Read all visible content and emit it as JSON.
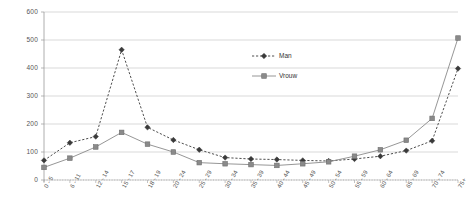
{
  "chart_data": {
    "type": "line",
    "title": "",
    "xlabel": "",
    "ylabel": "",
    "ylim": [
      0,
      600
    ],
    "ytick_step": 100,
    "grid": true,
    "legend_position": "center",
    "categories": [
      "0 - 5",
      "6 - 11",
      "12 - 14",
      "15 - 17",
      "18 - 19",
      "20 - 24",
      "25 - 29",
      "30 - 34",
      "35 - 39",
      "40 - 44",
      "45 - 49",
      "50 - 54",
      "55 - 59",
      "60 - 64",
      "65 - 69",
      "70 - 74",
      "75+"
    ],
    "ytick_labels": [
      "0",
      "100",
      "200",
      "300",
      "400",
      "500",
      "600"
    ],
    "series": [
      {
        "name": "Man",
        "color": "#3a3a3a",
        "line_style": "dashed",
        "marker": "diamond",
        "values": [
          70,
          133,
          155,
          465,
          188,
          143,
          108,
          80,
          75,
          73,
          70,
          68,
          75,
          85,
          105,
          140,
          398
        ]
      },
      {
        "name": "Vrouw",
        "color": "#8a8a8a",
        "line_style": "solid",
        "marker": "square",
        "values": [
          45,
          78,
          118,
          170,
          128,
          100,
          62,
          58,
          55,
          52,
          58,
          65,
          85,
          108,
          142,
          220,
          507
        ]
      }
    ]
  },
  "legend": {
    "items": [
      {
        "label": "Man"
      },
      {
        "label": "Vrouw"
      }
    ]
  },
  "axes": {
    "y_max_label": "600",
    "y_min_label": "0"
  }
}
